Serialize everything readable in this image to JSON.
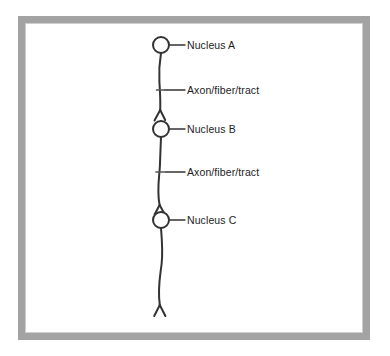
{
  "figure": {
    "type": "neuroanatomy-pathway-diagram",
    "background_color": "#ffffff",
    "frame_color": "#a3a3a3",
    "stroke_color": "#333333",
    "text_color": "#1d1d1d",
    "width": 390,
    "height": 356
  },
  "labels": {
    "nucleus_a": "Nucleus A",
    "axon_upper": "Axon/fiber/tract",
    "nucleus_b": "Nucleus B",
    "axon_lower": "Axon/fiber/tract",
    "nucleus_c": "Nucleus C"
  },
  "annotations": [
    {
      "id": "nucleus-a",
      "text": "Nucleus A",
      "marker": "circle",
      "x": 161,
      "y": 45,
      "label_x": 187,
      "label_y": 39
    },
    {
      "id": "axon-upper",
      "text": "Axon/fiber/tract",
      "marker": "tick",
      "x": 160,
      "y": 90,
      "label_x": 187,
      "label_y": 84
    },
    {
      "id": "nucleus-b",
      "text": "Nucleus B",
      "marker": "circle",
      "x": 161,
      "y": 129,
      "label_x": 187,
      "label_y": 123
    },
    {
      "id": "axon-lower",
      "text": "Axon/fiber/tract",
      "marker": "tick",
      "x": 160,
      "y": 172,
      "label_x": 187,
      "label_y": 166
    },
    {
      "id": "nucleus-c",
      "text": "Nucleus C",
      "marker": "circle",
      "x": 161,
      "y": 220,
      "label_x": 187,
      "label_y": 214
    }
  ],
  "structures": {
    "nuclei": [
      {
        "id": "A",
        "cx": 161,
        "cy": 45,
        "r": 8
      },
      {
        "id": "B",
        "cx": 161,
        "cy": 129,
        "r": 8
      },
      {
        "id": "C",
        "cx": 161,
        "cy": 220,
        "r": 8
      }
    ],
    "branch_points": [
      {
        "id": "branch-above-b",
        "apex_x": 160,
        "apex_y": 110
      },
      {
        "id": "branch-above-c",
        "apex_x": 160,
        "apex_y": 205
      },
      {
        "id": "terminal-fork",
        "apex_x": 160,
        "apex_y": 305
      }
    ],
    "tick_marks": [
      {
        "id": "tick-upper",
        "x": 160,
        "y": 90
      },
      {
        "id": "tick-lower",
        "x": 160,
        "y": 172
      }
    ]
  }
}
